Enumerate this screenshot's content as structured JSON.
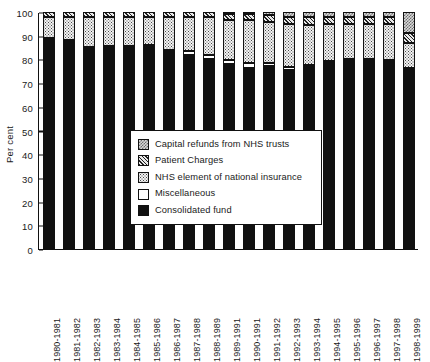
{
  "chart_data": {
    "type": "bar",
    "stacked": true,
    "title": "",
    "xlabel": "",
    "ylabel": "Per cent",
    "ylim": [
      0,
      100
    ],
    "yticks": [
      0,
      10,
      20,
      30,
      40,
      50,
      60,
      70,
      80,
      90,
      100
    ],
    "grid": false,
    "legend_position": "center-lower",
    "categories": [
      "1980-1981",
      "1981-1982",
      "1982-1983",
      "1983-1984",
      "1984-1985",
      "1985-1986",
      "1986-1987",
      "1987-1988",
      "1988-1989",
      "1989-1991",
      "1990-1991",
      "1991-1992",
      "1992-1993",
      "1993-1994",
      "1994-1995",
      "1995-1996",
      "1996-1997",
      "1997-1998",
      "1998-1999"
    ],
    "series": [
      {
        "name": "Consolidated fund",
        "pattern": "solid-black",
        "color": "#111111",
        "values": [
          88.7,
          87.8,
          85.0,
          85.2,
          85.3,
          85.5,
          83.5,
          82.0,
          80.2,
          78.0,
          76.5,
          77.2,
          75.5,
          77.0,
          78.8,
          79.5,
          79.8,
          79.3,
          76.0
        ]
      },
      {
        "name": "Miscellaneous",
        "pattern": "white",
        "color": "#ffffff",
        "values": [
          0.4,
          0.4,
          0.4,
          0.4,
          0.4,
          0.4,
          0.5,
          1.6,
          1.7,
          1.8,
          1.9,
          1.2,
          1.3,
          0.7,
          0.6,
          0.5,
          0.5,
          0.5,
          0.5
        ]
      },
      {
        "name": "NHS element of national insurance",
        "pattern": "dotted",
        "color": "#f2f2f2",
        "values": [
          8.9,
          9.8,
          12.6,
          12.4,
          12.3,
          12.1,
          13.8,
          14.2,
          15.8,
          17.0,
          18.2,
          17.4,
          18.0,
          16.8,
          15.4,
          14.8,
          14.5,
          15.0,
          10.5
        ]
      },
      {
        "name": "Patient Charges",
        "pattern": "diagonal-hatch",
        "color": "#bdbdbd",
        "values": [
          2.0,
          2.0,
          2.0,
          2.0,
          2.0,
          2.0,
          2.2,
          2.2,
          2.3,
          2.4,
          2.6,
          3.0,
          3.2,
          3.2,
          3.0,
          3.0,
          3.0,
          3.0,
          4.0
        ]
      },
      {
        "name": "Capital refunds from NHS trusts",
        "pattern": "checkered",
        "color": "#d8d8d8",
        "values": [
          0.0,
          0.0,
          0.0,
          0.0,
          0.0,
          0.0,
          0.0,
          0.0,
          0.0,
          0.8,
          0.8,
          1.2,
          2.0,
          2.3,
          2.2,
          2.2,
          2.2,
          2.2,
          9.0
        ]
      }
    ]
  },
  "legend": {
    "items": [
      {
        "label": "Capital refunds from NHS trusts",
        "key": "capital"
      },
      {
        "label": "Patient Charges",
        "key": "patient"
      },
      {
        "label": "NHS element of national insurance",
        "key": "nhsins"
      },
      {
        "label": "Miscellaneous",
        "key": "misc"
      },
      {
        "label": "Consolidated fund",
        "key": "consolidated"
      }
    ]
  }
}
